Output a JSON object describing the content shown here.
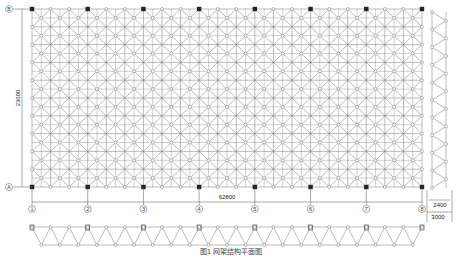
{
  "plan": {
    "columns": 21,
    "rows": 10,
    "x0": 32,
    "y0": 9,
    "x1": 422,
    "y1": 187,
    "axes_x": [
      "①",
      "②",
      "③",
      "④",
      "⑤",
      "⑥",
      "⑦",
      "⑧"
    ],
    "axes_y": [
      "Ⓑ",
      "Ⓐ"
    ],
    "span_label": "62800",
    "depth_label": "23600",
    "line_color": "#777777",
    "support_color": "#222222"
  },
  "side_section": {
    "label_inner": "2400",
    "label_outer": "3000"
  },
  "front_section": {
    "panels": 21
  },
  "caption": "图1  网架结构平面图"
}
